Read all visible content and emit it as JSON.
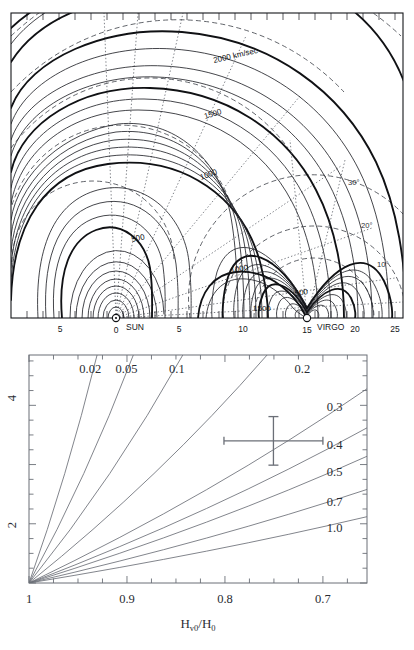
{
  "figure": {
    "panels": [
      "virgo-infall-contour-map",
      "h-ratio-fan-diagram"
    ]
  },
  "top_panel": {
    "name": "virgo-infall-velocity-contour-map",
    "axis": {
      "tick_labels": [
        "5",
        "0",
        "5",
        "10",
        "15",
        "20",
        "25"
      ],
      "tick_values": [
        -5,
        0,
        5,
        10,
        15,
        20,
        25
      ],
      "markers": [
        {
          "label": "SUN",
          "x": 0
        },
        {
          "label": "VIRGO",
          "x": 15
        }
      ]
    },
    "contour_labels": [
      {
        "text": "2000 km/sec",
        "x": 214,
        "y": 63,
        "rot": -13
      },
      {
        "text": "1500",
        "x": 205,
        "y": 119,
        "rot": -17
      },
      {
        "text": "1000",
        "x": 201,
        "y": 180,
        "rot": -20
      },
      {
        "text": "500",
        "x": 132,
        "y": 242,
        "rot": -12
      },
      {
        "text": "1000",
        "x": 231,
        "y": 273,
        "rot": -10
      },
      {
        "text": "1500",
        "x": 253,
        "y": 311,
        "rot": 0
      },
      {
        "text": "500",
        "x": 295,
        "y": 296,
        "rot": -8
      }
    ],
    "angle_labels": [
      {
        "text": "30°",
        "x": 348,
        "y": 185
      },
      {
        "text": "20°",
        "x": 361,
        "y": 228
      },
      {
        "text": "10°",
        "x": 377,
        "y": 267
      }
    ]
  },
  "bottom_panel": {
    "name": "hubble-ratio-fan-diagram",
    "axis_title_parts": {
      "main": "H",
      "sub1": "v0",
      "slash": "/",
      "main2": "H",
      "sub2": "0"
    },
    "axis_title_plain": "H_v0/H_0"
  },
  "chart_data": {
    "type": "line",
    "xlabel": "H_v0/H_0",
    "ylabel": "",
    "xlim": [
      1.0,
      0.655
    ],
    "ylim": [
      1.0,
      4.85
    ],
    "xticks": [
      1,
      0.9,
      0.8,
      0.7
    ],
    "xtick_labels": [
      "1",
      "0.9",
      "0.8",
      "0.7"
    ],
    "yticks": [
      2,
      3,
      4
    ],
    "ytick_labels": [
      "2",
      "",
      "4"
    ],
    "grid": false,
    "legend": "inline-curve-labels",
    "series": [
      {
        "name": "0.02",
        "label": "0.02",
        "origin": [
          1.0,
          1.0
        ],
        "end": [
          0.9305,
          4.85
        ],
        "label_pos": [
          0.9375,
          4.55
        ]
      },
      {
        "name": "0.05",
        "label": "0.05",
        "origin": [
          1.0,
          1.0
        ],
        "end": [
          0.8935,
          4.85
        ],
        "label_pos": [
          0.9005,
          4.55
        ]
      },
      {
        "name": "0.1",
        "label": "0.1",
        "origin": [
          1.0,
          1.0
        ],
        "end": [
          0.843,
          4.85
        ],
        "label_pos": [
          0.849,
          4.55
        ]
      },
      {
        "name": "0.2",
        "label": "0.2",
        "origin": [
          1.0,
          1.0
        ],
        "end": [
          0.757,
          4.85
        ],
        "label_pos": [
          0.721,
          4.55
        ]
      },
      {
        "name": "0.3",
        "label": "0.3",
        "origin": [
          1.0,
          1.0
        ],
        "end": [
          0.655,
          4.28
        ],
        "label_pos": [
          0.688,
          3.9
        ]
      },
      {
        "name": "0.4",
        "label": "0.4",
        "origin": [
          1.0,
          1.0
        ],
        "end": [
          0.655,
          3.62
        ],
        "label_pos": [
          0.688,
          3.26
        ]
      },
      {
        "name": "0.5",
        "label": "0.5",
        "origin": [
          1.0,
          1.0
        ],
        "end": [
          0.655,
          3.14
        ],
        "label_pos": [
          0.688,
          2.8
        ]
      },
      {
        "name": "0.7",
        "label": "0.7",
        "origin": [
          1.0,
          1.0
        ],
        "end": [
          0.655,
          2.58
        ],
        "label_pos": [
          0.688,
          2.3
        ]
      },
      {
        "name": "1.0",
        "label": "1.0",
        "origin": [
          1.0,
          1.0
        ],
        "end": [
          0.655,
          2.12
        ],
        "label_pos": [
          0.688,
          1.86
        ]
      }
    ],
    "datapoint": {
      "name": "measurement-with-errorbars",
      "x": 0.7505,
      "y": 3.4,
      "x_err_low": 0.0505,
      "x_err_high": 0.0505,
      "y_err_low": 0.41,
      "y_err_high": 0.41
    },
    "annotations": [
      {
        "text": "0.02"
      },
      {
        "text": "0.05"
      },
      {
        "text": "0.1"
      },
      {
        "text": "0.2"
      },
      {
        "text": "0.3"
      },
      {
        "text": "0.4"
      },
      {
        "text": "0.5"
      },
      {
        "text": "0.7"
      },
      {
        "text": "1.0"
      }
    ]
  },
  "colors": {
    "ink": "#101114",
    "contour_minor": "#23252b",
    "dashed": "#3a3d45",
    "dotted": "#53575f",
    "fan": "#6b6f77",
    "background": "#ffffff"
  }
}
